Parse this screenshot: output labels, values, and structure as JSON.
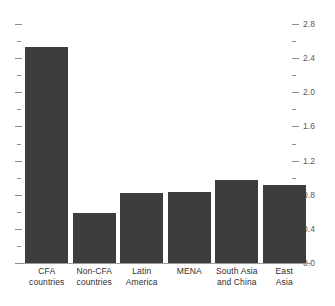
{
  "chart_data": {
    "type": "bar",
    "title": "",
    "subtitle": "",
    "xlabel": "",
    "ylabel": "",
    "categories": [
      "CFA countries",
      "Non-CFA countries",
      "Latin America",
      "MENA",
      "South Asia and China",
      "East Asia"
    ],
    "category_lines": [
      [
        "CFA",
        "countries"
      ],
      [
        "Non-CFA",
        "countries"
      ],
      [
        "Latin",
        "America"
      ],
      [
        "MENA"
      ],
      [
        "South Asia",
        "and China"
      ],
      [
        "East",
        "Asia"
      ]
    ],
    "values": [
      2.53,
      0.59,
      0.82,
      0.83,
      0.97,
      0.91
    ],
    "ylim": [
      0.0,
      2.9
    ],
    "ytick_labels": [
      "0.0",
      "0.4",
      "0.8",
      "1.2",
      "1.6",
      "2.0",
      "2.4",
      "2.8"
    ],
    "ytick_values": [
      0.0,
      0.4,
      0.8,
      1.2,
      1.6,
      2.0,
      2.4,
      2.8
    ],
    "minor_tick_values": [
      0.2,
      0.6,
      1.0,
      1.4,
      1.8,
      2.2,
      2.6
    ],
    "grid": false,
    "legend": null,
    "legend_position": "none",
    "axis_label_side": "right",
    "annotations": []
  },
  "style": {
    "bar_color": "#3d3d3d",
    "axis_color": "#9a9a9a",
    "tick_color": "#8d8d8d",
    "label_color": "#58585a",
    "category_color": "#2f2f2f",
    "background": "#ffffff"
  }
}
